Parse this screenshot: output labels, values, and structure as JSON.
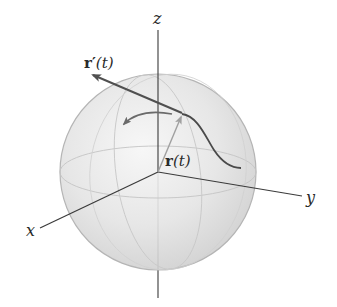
{
  "diagram": {
    "title": "",
    "axes": {
      "x_label": "x",
      "y_label": "y",
      "z_label": "z"
    },
    "vectors": {
      "position": {
        "label_bold": "r",
        "label_rest": "(t)"
      },
      "tangent": {
        "label_bold": "r′",
        "label_rest": "(t)"
      }
    },
    "colors": {
      "sphere_fill": "#dcdcdc",
      "sphere_edge": "#b5b5b5",
      "axis": "#2e2e2e",
      "curve": "#4a4a4a",
      "tangent_arrow": "#505050",
      "position_arrow": "#9a9a9a"
    }
  }
}
